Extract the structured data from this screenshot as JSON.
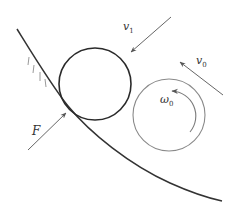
{
  "diagram": {
    "type": "physics-free-body",
    "colors": {
      "surface": "#333333",
      "ball_contact": "#2a2a2a",
      "ball_incoming": "#8a8a8a",
      "arrow": "#6a6a6a",
      "hatch": "#9a9a9a",
      "label": "#333333"
    },
    "labels": {
      "v1": {
        "base": "v",
        "sub": "1"
      },
      "v0": {
        "base": "v",
        "sub": "0"
      },
      "omega0": {
        "base": "ω",
        "sub": "0"
      },
      "F": {
        "base": "F"
      }
    },
    "elements": {
      "surface": "curved wall/ground surface with hatching",
      "ball_contact": "ball touching the surface",
      "ball_incoming": "ball with initial velocity v0 and spin ω0",
      "arrow_v1": "velocity v1 of contact ball",
      "arrow_v0": "initial velocity v0",
      "arrow_F": "force F at contact point",
      "arc_omega0": "rotation direction ω0 (counter-clockwise)"
    }
  }
}
